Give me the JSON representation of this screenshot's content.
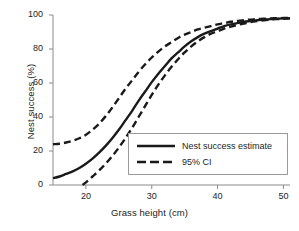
{
  "chart_data": {
    "type": "line",
    "title": "",
    "xlabel": "Grass height (cm)",
    "ylabel": "Nest success (%)",
    "xlim": [
      15,
      51
    ],
    "ylim": [
      0,
      100
    ],
    "xticks": [
      "20",
      "30",
      "40",
      "50"
    ],
    "xtick_values": [
      20,
      30,
      40,
      50
    ],
    "yticks": [
      "0",
      "20",
      "40",
      "60",
      "80",
      "100"
    ],
    "ytick_values": [
      0,
      20,
      40,
      60,
      80,
      100
    ],
    "grid": false,
    "legend_position": "lower right",
    "series": [
      {
        "name": "Nest success estimate",
        "style": "solid",
        "color": "#1a1a1a",
        "x": [
          15,
          16,
          17,
          18,
          19,
          20,
          21,
          22,
          23,
          24,
          25,
          26,
          27,
          28,
          29,
          30,
          31,
          32,
          33,
          34,
          35,
          36,
          37,
          38,
          39,
          40,
          41,
          42,
          43,
          44,
          45,
          46,
          47,
          48,
          49,
          50,
          51
        ],
        "values": [
          4,
          5,
          6.5,
          8,
          10,
          12.5,
          15.5,
          19,
          23,
          27.5,
          32.5,
          38,
          43.5,
          49.5,
          55,
          60.5,
          65.5,
          70,
          74.5,
          78,
          81.5,
          84.5,
          87,
          89,
          90.5,
          92,
          93.5,
          94.5,
          95.2,
          96,
          96.5,
          97,
          97.3,
          97.6,
          97.8,
          98,
          98
        ]
      },
      {
        "name": "95% CI upper",
        "style": "dashed",
        "color": "#1a1a1a",
        "x": [
          15,
          16,
          17,
          18,
          19,
          20,
          21,
          22,
          23,
          24,
          25,
          26,
          27,
          28,
          29,
          30,
          31,
          32,
          33,
          34,
          35,
          36,
          37,
          38,
          39,
          40,
          41,
          42,
          43,
          44,
          45,
          46,
          47,
          48,
          49,
          50,
          51
        ],
        "values": [
          24,
          24.3,
          25,
          26,
          27.5,
          29.5,
          32.5,
          36,
          40.5,
          45.5,
          51,
          56.5,
          61.5,
          66.5,
          71,
          75,
          78.5,
          81.5,
          84,
          86.5,
          88.5,
          90,
          91.5,
          92.5,
          93.5,
          94.5,
          95.2,
          96,
          96.5,
          97,
          97.3,
          97.6,
          97.8,
          98,
          98.1,
          98.2,
          98.3
        ]
      },
      {
        "name": "95% CI lower",
        "style": "dashed",
        "color": "#1a1a1a",
        "x": [
          19.5,
          20,
          21,
          22,
          23,
          24,
          25,
          26,
          27,
          28,
          29,
          30,
          31,
          32,
          33,
          34,
          35,
          36,
          37,
          38,
          39,
          40,
          41,
          42,
          43,
          44,
          45,
          46,
          47,
          48,
          49,
          50,
          51
        ],
        "values": [
          0,
          1.5,
          5,
          8.5,
          12.5,
          17,
          22,
          27.5,
          33.5,
          40,
          46.5,
          53,
          59,
          64.5,
          69.5,
          74,
          78,
          81.5,
          84.5,
          87,
          89,
          90.5,
          92,
          93.2,
          94.2,
          95,
          95.8,
          96.4,
          96.9,
          97.3,
          97.6,
          97.8,
          98
        ]
      }
    ],
    "legend": [
      {
        "label": "Nest success estimate",
        "style": "solid"
      },
      {
        "label": "95% CI",
        "style": "dashed"
      }
    ]
  },
  "colors": {
    "line": "#1a1a1a",
    "axis": "#8a8a8a",
    "legend_border": "#9a9a9a",
    "background": "#ffffff",
    "text": "#1d1d1d"
  }
}
